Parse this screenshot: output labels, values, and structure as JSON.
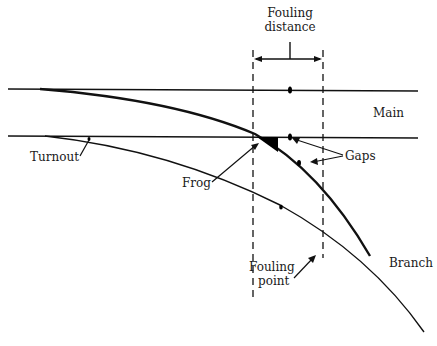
{
  "diagram": {
    "type": "railway-turnout-schematic",
    "labels": {
      "fouling_distance_line1": "Fouling",
      "fouling_distance_line2": "distance",
      "main": "Main",
      "turnout": "Turnout",
      "gaps": "Gaps",
      "frog": "Frog",
      "branch": "Branch",
      "fouling_point_line1": "Fouling",
      "fouling_point_line2": "point"
    },
    "colors": {
      "line": "#111111",
      "background": "#ffffff"
    }
  }
}
